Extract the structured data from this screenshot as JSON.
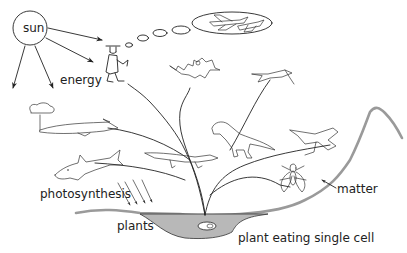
{
  "diagram": {
    "type": "evolution / energy-matter tree illustration",
    "labels": {
      "sun": "sun",
      "energy": "energy",
      "photosynthesis": "photosynthesis",
      "plants": "plants",
      "single_cell": "plant eating single cell",
      "matter": "matter"
    },
    "figures": [
      "sun-circle",
      "thinking-person",
      "thought-bubble-airplane",
      "bat",
      "pterosaur",
      "theropod-dinosaur",
      "flying-reptile",
      "fly-insect",
      "whale",
      "shark",
      "lizard-reptile",
      "tree-plant",
      "water-pool",
      "mountain-ground"
    ],
    "colors": {
      "line": "#222222",
      "ground": "#9a9a9a",
      "water": "#b8b8b8",
      "background": "#ffffff"
    }
  }
}
